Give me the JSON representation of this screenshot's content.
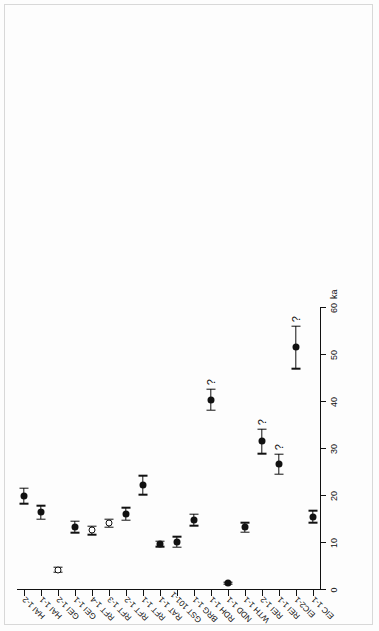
{
  "chart_data": {
    "type": "scatter",
    "title": "",
    "xlabel": "ka",
    "ylabel": "",
    "xlim": [
      0,
      60
    ],
    "xticks": [
      0,
      10,
      20,
      30,
      40,
      50,
      60
    ],
    "xticklabels": [
      "0",
      "10",
      "20",
      "30",
      "40",
      "50",
      "60"
    ],
    "grid": false,
    "legend": null,
    "orientation": "horizontal-dot-plot",
    "categories": [
      "HAI 1-2",
      "HAI 1-1",
      "GEI 1-2",
      "GEI 1-1",
      "RFT 1-4",
      "RFT 1-3",
      "RFT 1-2",
      "RFT 1-1",
      "RAT 1-1",
      "GST 101-1",
      "BRG 1-1",
      "RDH 1-1",
      "NDD 1-1",
      "WTH 1-1",
      "REI 1-2",
      "REI 1-1",
      "EIC2-1",
      "EIC 1-1"
    ],
    "points": [
      {
        "label": "HAI 1-2",
        "value": 20.0,
        "err_low": 1.6,
        "err_high": 1.6,
        "marker": "filled",
        "flag": ""
      },
      {
        "label": "HAI 1-1",
        "value": 16.5,
        "err_low": 1.4,
        "err_high": 1.4,
        "marker": "filled",
        "flag": ""
      },
      {
        "label": "GEI 1-2",
        "value": 4.3,
        "err_low": 0.5,
        "err_high": 0.5,
        "marker": "open",
        "flag": ""
      },
      {
        "label": "GEI 1-1",
        "value": 13.4,
        "err_low": 1.2,
        "err_high": 1.2,
        "marker": "filled",
        "flag": ""
      },
      {
        "label": "RFT 1-4",
        "value": 12.7,
        "err_low": 0.9,
        "err_high": 0.9,
        "marker": "open",
        "flag": ""
      },
      {
        "label": "RFT 1-3",
        "value": 14.2,
        "err_low": 0.8,
        "err_high": 0.8,
        "marker": "open",
        "flag": ""
      },
      {
        "label": "RFT 1-2",
        "value": 16.2,
        "err_low": 1.3,
        "err_high": 1.3,
        "marker": "filled",
        "flag": ""
      },
      {
        "label": "RFT 1-1",
        "value": 22.3,
        "err_low": 2.0,
        "err_high": 2.0,
        "marker": "filled",
        "flag": ""
      },
      {
        "label": "RAT 1-1",
        "value": 9.8,
        "err_low": 0.6,
        "err_high": 0.6,
        "marker": "filled",
        "flag": ""
      },
      {
        "label": "GST 101-1",
        "value": 10.2,
        "err_low": 1.1,
        "err_high": 1.1,
        "marker": "filled",
        "flag": ""
      },
      {
        "label": "BRG 1-1",
        "value": 14.9,
        "err_low": 1.2,
        "err_high": 1.2,
        "marker": "filled",
        "flag": ""
      },
      {
        "label": "RDH 1-1",
        "value": 40.5,
        "err_low": 2.2,
        "err_high": 2.2,
        "marker": "filled",
        "flag": "?"
      },
      {
        "label": "NDD 1-1",
        "value": 1.4,
        "err_low": 0.2,
        "err_high": 0.2,
        "marker": "filled",
        "flag": ""
      },
      {
        "label": "WTH 1-1",
        "value": 13.3,
        "err_low": 1.0,
        "err_high": 1.0,
        "marker": "filled",
        "flag": ""
      },
      {
        "label": "REI 1-2",
        "value": 31.6,
        "err_low": 2.6,
        "err_high": 2.6,
        "marker": "filled",
        "flag": "?"
      },
      {
        "label": "REI 1-1",
        "value": 26.8,
        "err_low": 2.1,
        "err_high": 2.1,
        "marker": "filled",
        "flag": "?"
      },
      {
        "label": "EIC2-1",
        "value": 51.6,
        "err_low": 4.5,
        "err_high": 4.5,
        "marker": "filled",
        "flag": "?"
      },
      {
        "label": "EIC 1-1",
        "value": 15.6,
        "err_low": 1.3,
        "err_high": 1.3,
        "marker": "filled",
        "flag": ""
      }
    ]
  },
  "colors": {
    "ink": "#111111",
    "page": "#ffffff",
    "border": "#d8d8d8"
  }
}
